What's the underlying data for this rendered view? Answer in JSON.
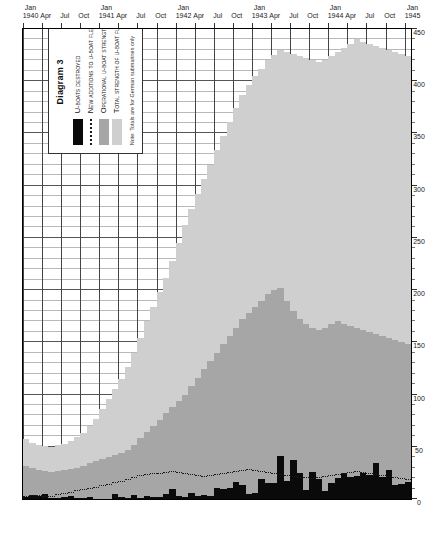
{
  "legend": {
    "title": "Diagram 3",
    "items": [
      {
        "label": "U-Boats Destroyed",
        "swatch": "black",
        "color": "#0a0a0a"
      },
      {
        "label": "New Additions to U-Boat Fleet",
        "swatch": "dotted",
        "color": "#1a1a1a"
      },
      {
        "label": "Operational U-Boat Strength",
        "swatch": "mid",
        "color": "#a6a6a6"
      },
      {
        "label": "Total Strength of U-Boat Fleet",
        "swatch": "light",
        "color": "#cfcfcf"
      }
    ],
    "note": "Note: Totals are for German submarines only"
  },
  "axes": {
    "value_ticks": [
      "0",
      "50",
      "100",
      "150",
      "200",
      "250",
      "300",
      "350",
      "400",
      "450"
    ],
    "time_ticks": [
      {
        "month": "Jan",
        "year": "1940"
      },
      {
        "month": "Apr",
        "year": ""
      },
      {
        "month": "Jul",
        "year": ""
      },
      {
        "month": "Oct",
        "year": ""
      },
      {
        "month": "Jan",
        "year": "1941"
      },
      {
        "month": "Apr",
        "year": ""
      },
      {
        "month": "Jul",
        "year": ""
      },
      {
        "month": "Oct",
        "year": ""
      },
      {
        "month": "Jan",
        "year": "1942"
      },
      {
        "month": "Apr",
        "year": ""
      },
      {
        "month": "Jul",
        "year": ""
      },
      {
        "month": "Oct",
        "year": ""
      },
      {
        "month": "Jan",
        "year": "1943"
      },
      {
        "month": "Apr",
        "year": ""
      },
      {
        "month": "Jul",
        "year": ""
      },
      {
        "month": "Oct",
        "year": ""
      },
      {
        "month": "Jan",
        "year": "1944"
      },
      {
        "month": "Apr",
        "year": ""
      },
      {
        "month": "Jul",
        "year": ""
      },
      {
        "month": "Oct",
        "year": ""
      },
      {
        "month": "Jan",
        "year": "1945"
      }
    ]
  },
  "chart_data": {
    "type": "bar",
    "orientation": "horizontal",
    "title": "Diagram 3",
    "xlabel": "",
    "ylabel": "",
    "xlim": [
      0,
      450
    ],
    "grid": true,
    "legend_position": "inside-left",
    "note": "Note: Totals are for German submarines only",
    "categories": [
      "Jan 1940",
      "Feb 1940",
      "Mar 1940",
      "Apr 1940",
      "May 1940",
      "Jun 1940",
      "Jul 1940",
      "Aug 1940",
      "Sep 1940",
      "Oct 1940",
      "Nov 1940",
      "Dec 1940",
      "Jan 1941",
      "Feb 1941",
      "Mar 1941",
      "Apr 1941",
      "May 1941",
      "Jun 1941",
      "Jul 1941",
      "Aug 1941",
      "Sep 1941",
      "Oct 1941",
      "Nov 1941",
      "Dec 1941",
      "Jan 1942",
      "Feb 1942",
      "Mar 1942",
      "Apr 1942",
      "May 1942",
      "Jun 1942",
      "Jul 1942",
      "Aug 1942",
      "Sep 1942",
      "Oct 1942",
      "Nov 1942",
      "Dec 1942",
      "Jan 1943",
      "Feb 1943",
      "Mar 1943",
      "Apr 1943",
      "May 1943",
      "Jun 1943",
      "Jul 1943",
      "Aug 1943",
      "Sep 1943",
      "Oct 1943",
      "Nov 1943",
      "Dec 1943",
      "Jan 1944",
      "Feb 1944",
      "Mar 1944",
      "Apr 1944",
      "May 1944",
      "Jun 1944",
      "Jul 1944",
      "Aug 1944",
      "Sep 1944",
      "Oct 1944",
      "Nov 1944",
      "Dec 1944",
      "Jan 1945"
    ],
    "series": [
      {
        "name": "Total Strength of U-Boat Fleet",
        "color": "#cfcfcf",
        "values": [
          57,
          54,
          52,
          51,
          50,
          52,
          53,
          56,
          59,
          63,
          70,
          77,
          86,
          96,
          105,
          115,
          126,
          140,
          154,
          170,
          184,
          198,
          212,
          228,
          245,
          262,
          278,
          292,
          306,
          320,
          334,
          348,
          361,
          374,
          387,
          396,
          405,
          412,
          420,
          425,
          430,
          428,
          426,
          424,
          422,
          420,
          418,
          420,
          424,
          428,
          432,
          436,
          440,
          438,
          436,
          434,
          432,
          430,
          428,
          426,
          424
        ]
      },
      {
        "name": "Operational U-Boat Strength",
        "color": "#a6a6a6",
        "values": [
          32,
          30,
          28,
          27,
          26,
          27,
          28,
          29,
          30,
          32,
          34,
          36,
          38,
          40,
          42,
          44,
          47,
          52,
          58,
          64,
          70,
          76,
          82,
          88,
          94,
          100,
          108,
          116,
          124,
          132,
          140,
          148,
          156,
          164,
          172,
          178,
          184,
          190,
          196,
          200,
          202,
          190,
          180,
          172,
          168,
          164,
          162,
          164,
          168,
          170,
          168,
          166,
          164,
          162,
          160,
          158,
          156,
          154,
          152,
          150,
          148
        ]
      },
      {
        "name": "U-Boats Destroyed",
        "color": "#0a0a0a",
        "values": [
          2,
          4,
          3,
          5,
          1,
          1,
          2,
          3,
          1,
          1,
          2,
          0,
          0,
          0,
          5,
          2,
          1,
          4,
          1,
          3,
          2,
          2,
          5,
          10,
          3,
          2,
          6,
          3,
          4,
          3,
          11,
          10,
          11,
          16,
          13,
          5,
          6,
          19,
          15,
          15,
          41,
          17,
          37,
          25,
          9,
          26,
          19,
          8,
          15,
          20,
          25,
          21,
          22,
          25,
          23,
          34,
          21,
          28,
          13,
          14,
          16
        ]
      },
      {
        "name": "New Additions to U-Boat Fleet",
        "color": "#1a1a1a",
        "style": "dotted-line",
        "values": [
          2,
          3,
          3,
          2,
          2,
          4,
          5,
          6,
          8,
          9,
          10,
          11,
          12,
          13,
          15,
          16,
          18,
          20,
          22,
          23,
          24,
          24,
          25,
          26,
          25,
          24,
          23,
          22,
          21,
          22,
          23,
          24,
          25,
          26,
          27,
          28,
          27,
          26,
          25,
          24,
          23,
          22,
          21,
          20,
          20,
          19,
          20,
          21,
          22,
          23,
          24,
          25,
          26,
          25,
          24,
          23,
          22,
          21,
          20,
          19,
          18
        ]
      }
    ]
  }
}
